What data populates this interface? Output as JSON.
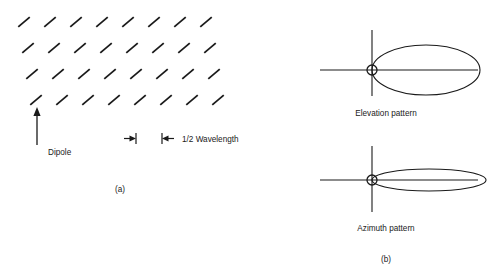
{
  "figure": {
    "background_color": "#ffffff",
    "line_color": "#1a1a1a",
    "panel_a": {
      "caption": "(a)",
      "dipole_label": "Dipole",
      "spacing_label": "1/2 Wavelength",
      "array": {
        "rows": 4,
        "columns": 8,
        "element_angle_deg": 40,
        "element_length": 15,
        "col_spacing": 26,
        "row_spacing": 26,
        "row_offset": 4,
        "origin_x": 24,
        "origin_y": 22
      }
    },
    "panel_b": {
      "caption": "(b)",
      "patterns": [
        {
          "name": "elevation",
          "label": "Elevation pattern",
          "center_x": 372,
          "center_y": 70,
          "axis_x_start": 320,
          "axis_x_end": 478,
          "axis_y_start": 30,
          "axis_y_end": 96,
          "feed_radius": 5,
          "lobe_rx": 54,
          "lobe_ry": 25,
          "label_x": 386,
          "label_y": 116
        },
        {
          "name": "azimuth",
          "label": "Azimuth pattern",
          "center_x": 372,
          "center_y": 180,
          "axis_x_start": 320,
          "axis_x_end": 478,
          "axis_y_start": 146,
          "axis_y_end": 212,
          "feed_radius": 5,
          "lobe_rx": 57,
          "lobe_ry": 11,
          "label_x": 386,
          "label_y": 231
        }
      ]
    }
  }
}
